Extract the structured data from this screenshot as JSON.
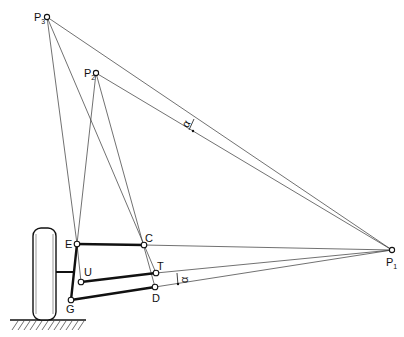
{
  "diagram": {
    "type": "suspension-instant-center-geometry",
    "points": {
      "P1": {
        "label": "P",
        "sub": "1"
      },
      "P2": {
        "label": "P",
        "sub": "2"
      },
      "P3": {
        "label": "P",
        "sub": "3"
      },
      "E": {
        "label": "E"
      },
      "C": {
        "label": "C"
      },
      "U": {
        "label": "U"
      },
      "T": {
        "label": "T"
      },
      "D": {
        "label": "D"
      },
      "G": {
        "label": "G"
      }
    },
    "angle_labels": {
      "upper": "α",
      "lower": "α"
    }
  }
}
